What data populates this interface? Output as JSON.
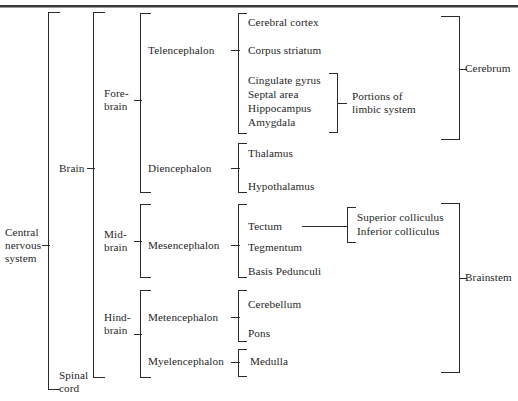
{
  "figure": {
    "type": "hierarchical-bracket-diagram",
    "top_rule": true
  },
  "root": {
    "label": "Central\nnervous\nsystem"
  },
  "level1": [
    {
      "label": "Brain"
    },
    {
      "label": "Spinal\ncord"
    }
  ],
  "level2": [
    {
      "label": "Fore-\nbrain"
    },
    {
      "label": "Mid-\nbrain"
    },
    {
      "label": "Hind-\nbrain"
    }
  ],
  "level3": [
    {
      "label": "Telencephalon"
    },
    {
      "label": "Diencephalon"
    },
    {
      "label": "Mesencephalon"
    },
    {
      "label": "Metencephalon"
    },
    {
      "label": "Myelencephalon"
    }
  ],
  "level4": {
    "telencephalon": [
      {
        "label": "Cerebral cortex"
      },
      {
        "label": "Corpus striatum"
      },
      {
        "label": "Cingulate gyrus"
      },
      {
        "label": "Septal area"
      },
      {
        "label": "Hippocampus"
      },
      {
        "label": "Amygdala"
      }
    ],
    "diencephalon": [
      {
        "label": "Thalamus"
      },
      {
        "label": "Hypothalamus"
      }
    ],
    "mesencephalon": [
      {
        "label": "Tectum"
      },
      {
        "label": "Tegmentum"
      },
      {
        "label": "Basis Pedunculi"
      }
    ],
    "metencephalon": [
      {
        "label": "Cerebellum"
      },
      {
        "label": "Pons"
      }
    ],
    "myelencephalon": [
      {
        "label": "Medulla"
      }
    ]
  },
  "level5": {
    "tectum": [
      {
        "label": "Superior colliculus"
      },
      {
        "label": "Inferior colliculus"
      }
    ]
  },
  "annotations": {
    "limbic": "Portions of\nlimbic system",
    "cerebrum": "Cerebrum",
    "brainstem": "Brainstem"
  },
  "colors": {
    "ink": "#1f1f1f",
    "rule": "#3a3a3a",
    "line": "#2b2b2b",
    "background": "#ffffff"
  }
}
